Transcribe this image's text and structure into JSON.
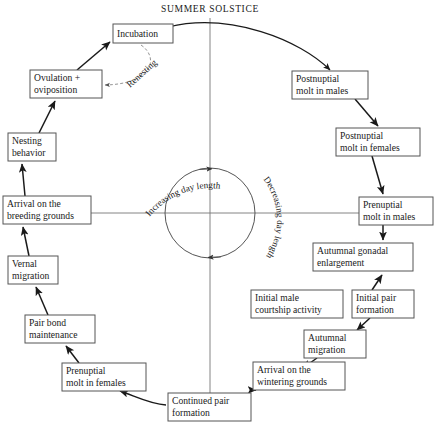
{
  "diagram": {
    "title": "SUMMER SOLSTICE",
    "center": {
      "label_left": "Increasing day length",
      "label_right": "Decreasing day length"
    },
    "edge_labels": {
      "renesting": "Renesting"
    },
    "nodes": [
      {
        "id": "incubation",
        "label": "Incubation",
        "x": 113,
        "y": 24,
        "w": 60,
        "h": 19
      },
      {
        "id": "ovulation",
        "label": "Ovulation +\noviposition",
        "x": 30,
        "y": 70,
        "w": 72,
        "h": 28
      },
      {
        "id": "nesting",
        "label": "Nesting\nbehavior",
        "x": 8,
        "y": 133,
        "w": 48,
        "h": 28
      },
      {
        "id": "arrival-breeding",
        "label": "Arrival on the\nbreeding grounds",
        "x": 3,
        "y": 196,
        "w": 88,
        "h": 28
      },
      {
        "id": "vernal",
        "label": "Vernal\nmigration",
        "x": 8,
        "y": 256,
        "w": 50,
        "h": 28
      },
      {
        "id": "pairbond",
        "label": "Pair bond\nmaintenance",
        "x": 25,
        "y": 315,
        "w": 70,
        "h": 28
      },
      {
        "id": "prenuptial-f",
        "label": "Prenuptial\nmolt in females",
        "x": 62,
        "y": 363,
        "w": 84,
        "h": 28
      },
      {
        "id": "continued-pair",
        "label": "Continued pair\nformation",
        "x": 168,
        "y": 393,
        "w": 83,
        "h": 28
      },
      {
        "id": "arrival-wintering",
        "label": "Arrival on the\nwintering grounds",
        "x": 253,
        "y": 362,
        "w": 92,
        "h": 28
      },
      {
        "id": "autumnal-migration",
        "label": "Autumnal\nmigration",
        "x": 304,
        "y": 330,
        "w": 62,
        "h": 28
      },
      {
        "id": "initial-pair",
        "label": "Initial pair\nformation",
        "x": 352,
        "y": 290,
        "w": 62,
        "h": 28
      },
      {
        "id": "initial-courtship",
        "label": "Initial male\ncourtship activity",
        "x": 251,
        "y": 290,
        "w": 92,
        "h": 28
      },
      {
        "id": "autumnal-gonadal",
        "label": "Autumnal gonadal\nenlargement",
        "x": 313,
        "y": 243,
        "w": 100,
        "h": 28
      },
      {
        "id": "prenuptial-m",
        "label": "Prenuptial\nmolt in males",
        "x": 359,
        "y": 197,
        "w": 74,
        "h": 28
      },
      {
        "id": "postnuptial-f",
        "label": "Postnuptial\nmolt in females",
        "x": 336,
        "y": 128,
        "w": 84,
        "h": 28
      },
      {
        "id": "postnuptial-m",
        "label": "Postnuptial\nmolt in males",
        "x": 292,
        "y": 71,
        "w": 76,
        "h": 28
      }
    ],
    "edges": [
      {
        "from": "nesting",
        "to": "ovulation",
        "style": "solid"
      },
      {
        "from": "arrival-breeding",
        "to": "nesting",
        "style": "solid"
      },
      {
        "from": "vernal",
        "to": "arrival-breeding",
        "style": "solid"
      },
      {
        "from": "pairbond",
        "to": "vernal",
        "style": "solid"
      },
      {
        "from": "prenuptial-f",
        "to": "pairbond",
        "style": "solid"
      },
      {
        "from": "continued-pair",
        "to": "prenuptial-f",
        "style": "solid"
      },
      {
        "from": "arrival-wintering",
        "to": "continued-pair",
        "style": "solid"
      },
      {
        "from": "autumnal-migration",
        "to": "arrival-wintering",
        "style": "solid"
      },
      {
        "from": "initial-pair",
        "to": "autumnal-migration",
        "style": "solid"
      },
      {
        "from": "autumnal-gonadal",
        "to": "initial-pair",
        "style": "solid"
      },
      {
        "from": "prenuptial-m",
        "to": "autumnal-gonadal",
        "style": "solid"
      },
      {
        "from": "postnuptial-f",
        "to": "prenuptial-m",
        "style": "solid"
      },
      {
        "from": "postnuptial-m",
        "to": "postnuptial-f",
        "style": "solid"
      },
      {
        "from": "incubation",
        "to": "postnuptial-m",
        "style": "arc"
      },
      {
        "from": "ovulation",
        "to": "incubation",
        "style": "solid"
      },
      {
        "from": "incubation",
        "to": "ovulation",
        "style": "dashed",
        "label": "Renesting"
      }
    ]
  }
}
